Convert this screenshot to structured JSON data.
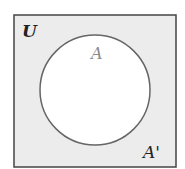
{
  "diagram": {
    "type": "venn",
    "universe_label": "U",
    "set_label": "A",
    "complement_label": "A'",
    "colors": {
      "universe_fill": "#ececec",
      "set_fill": "#ffffff",
      "stroke": "#444444",
      "set_label_color": "#8a8a8a",
      "text_color": "#222222"
    }
  }
}
